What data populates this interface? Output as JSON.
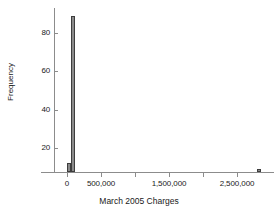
{
  "chart_data": {
    "type": "bar",
    "title": "",
    "subtitle": "",
    "xlabel": "March 2005 Charges",
    "ylabel": "Frequency",
    "xlim": [
      -250000,
      3050000
    ],
    "ylim": [
      0,
      95
    ],
    "grid": false,
    "legend": null,
    "x_ticks": [
      {
        "value": 0,
        "label": "0"
      },
      {
        "value": 500000,
        "label": "500,000"
      },
      {
        "value": 1000000,
        "label": ""
      },
      {
        "value": 1500000,
        "label": "1,500,000"
      },
      {
        "value": 2000000,
        "label": ""
      },
      {
        "value": 2500000,
        "label": "2,500,000"
      }
    ],
    "y_ticks": [
      {
        "value": 20,
        "label": "20"
      },
      {
        "value": 40,
        "label": "40"
      },
      {
        "value": 60,
        "label": "60"
      },
      {
        "value": 80,
        "label": "80"
      }
    ],
    "bin_width": 60000,
    "bars": [
      {
        "x_center": 30000,
        "x_left": 0,
        "x_right": 60000,
        "value": 5
      },
      {
        "x_center": 90000,
        "x_left": 60000,
        "x_right": 120000,
        "value": 90
      },
      {
        "x_center": 2830000,
        "x_left": 2800000,
        "x_right": 2860000,
        "value": 1
      }
    ],
    "colors": {
      "bar_fill": "#8a8a8a",
      "bar_stroke": "#3d3d3d",
      "axis": "#8c8c8c",
      "text": "#1a1a1a",
      "background": "#ffffff"
    }
  }
}
